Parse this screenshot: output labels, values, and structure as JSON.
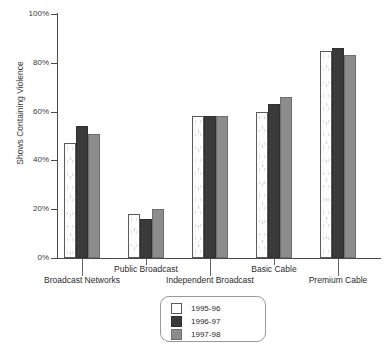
{
  "chart_data": {
    "type": "bar",
    "title": "",
    "xlabel": "",
    "ylabel": "Shows Containing Violence",
    "ylim": [
      0,
      100
    ],
    "ytick_labels": [
      "0%",
      "20%",
      "40%",
      "60%",
      "80%",
      "100%"
    ],
    "ytick_values": [
      0,
      20,
      40,
      60,
      80,
      100
    ],
    "grid": false,
    "legend_position": "bottom-center",
    "categories": [
      "Broadcast Networks",
      "Public Broadcast",
      "Independent Broadcast",
      "Basic Cable",
      "Premium Cable"
    ],
    "series": [
      {
        "name": "1995-96",
        "color": "#fdfdfd",
        "values": [
          47,
          18,
          58,
          60,
          85
        ]
      },
      {
        "name": "1996-97",
        "color": "#3a3a3a",
        "values": [
          54,
          16,
          58,
          63,
          86
        ]
      },
      {
        "name": "1997-98",
        "color": "#8c8c8c",
        "values": [
          51,
          20,
          58,
          66,
          83
        ]
      }
    ]
  },
  "legend": {
    "items": [
      {
        "label": "1995-96"
      },
      {
        "label": "1996-97"
      },
      {
        "label": "1997-98"
      }
    ]
  }
}
